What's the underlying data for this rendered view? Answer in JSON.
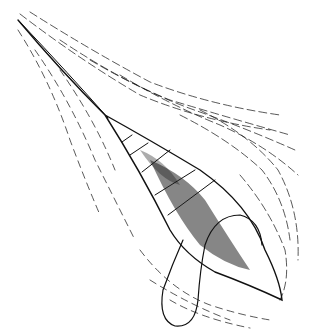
{
  "image": {
    "kind": "line-drawing",
    "subject": "surgical incision illustration with retracted tissue and drain loop",
    "width": 310,
    "height": 334,
    "background": "#ffffff",
    "ink": "#111111"
  }
}
